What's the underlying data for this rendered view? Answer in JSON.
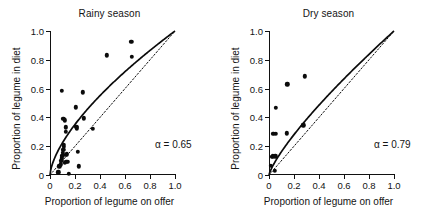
{
  "figure": {
    "background": "#ffffff",
    "marker_color": "#0b0b0b",
    "axis_color": "#111111"
  },
  "axis": {
    "x_title": "Proportion of legume on offer",
    "y_title": "Proportion of legume in diet",
    "ticks": [
      "0",
      "0.2",
      "0.4",
      "0.6",
      "0.8",
      "1.0"
    ],
    "tick_values": [
      0,
      0.2,
      0.4,
      0.6,
      0.8,
      1.0
    ],
    "xlim": [
      0,
      1.0
    ],
    "ylim": [
      0,
      1.0
    ]
  },
  "chart_data": [
    {
      "type": "scatter",
      "title": "Rainy season",
      "xlabel": "Proportion of legume on offer",
      "ylabel": "Proportion of legume in diet",
      "xlim": [
        0,
        1.0
      ],
      "ylim": [
        0,
        1.0
      ],
      "xticks": [
        0,
        0.2,
        0.4,
        0.6,
        0.8,
        1.0
      ],
      "yticks": [
        0,
        0.2,
        0.4,
        0.6,
        0.8,
        1.0
      ],
      "grid": false,
      "legend": "none",
      "annotation": "α = 0.65",
      "alpha": 0.65,
      "points": [
        {
          "x": 0.065,
          "y": 0.02
        },
        {
          "x": 0.075,
          "y": 0.06
        },
        {
          "x": 0.085,
          "y": 0.075
        },
        {
          "x": 0.09,
          "y": 0.1
        },
        {
          "x": 0.095,
          "y": 0.115
        },
        {
          "x": 0.098,
          "y": 0.135
        },
        {
          "x": 0.1,
          "y": 0.155
        },
        {
          "x": 0.105,
          "y": 0.175
        },
        {
          "x": 0.11,
          "y": 0.195
        },
        {
          "x": 0.112,
          "y": 0.21
        },
        {
          "x": 0.095,
          "y": 0.585
        },
        {
          "x": 0.105,
          "y": 0.39
        },
        {
          "x": 0.12,
          "y": 0.38
        },
        {
          "x": 0.125,
          "y": 0.33
        },
        {
          "x": 0.128,
          "y": 0.3
        },
        {
          "x": 0.12,
          "y": 0.085
        },
        {
          "x": 0.13,
          "y": 0.09
        },
        {
          "x": 0.14,
          "y": 0.09
        },
        {
          "x": 0.128,
          "y": 0.14
        },
        {
          "x": 0.135,
          "y": 0.145
        },
        {
          "x": 0.15,
          "y": 0.01
        },
        {
          "x": 0.205,
          "y": 0.47
        },
        {
          "x": 0.21,
          "y": 0.335
        },
        {
          "x": 0.215,
          "y": 0.325
        },
        {
          "x": 0.222,
          "y": 0.16
        },
        {
          "x": 0.228,
          "y": 0.06
        },
        {
          "x": 0.26,
          "y": 0.575
        },
        {
          "x": 0.27,
          "y": 0.395
        },
        {
          "x": 0.34,
          "y": 0.32
        },
        {
          "x": 0.455,
          "y": 0.83
        },
        {
          "x": 0.65,
          "y": 0.925
        },
        {
          "x": 0.655,
          "y": 0.82
        }
      ]
    },
    {
      "type": "scatter",
      "title": "Dry season",
      "xlabel": "Proportion of legume on offer",
      "ylabel": "Proportion of legume in diet",
      "xlim": [
        0,
        1.0
      ],
      "ylim": [
        0,
        1.0
      ],
      "xticks": [
        0,
        0.2,
        0.4,
        0.6,
        0.8,
        1.0
      ],
      "yticks": [
        0,
        0.2,
        0.4,
        0.6,
        0.8,
        1.0
      ],
      "grid": false,
      "legend": "none",
      "annotation": "α = 0.79",
      "alpha": 0.79,
      "points": [
        {
          "x": 0.015,
          "y": 0.065
        },
        {
          "x": 0.02,
          "y": 0.125
        },
        {
          "x": 0.03,
          "y": 0.13
        },
        {
          "x": 0.035,
          "y": 0.285
        },
        {
          "x": 0.048,
          "y": 0.03
        },
        {
          "x": 0.05,
          "y": 0.13
        },
        {
          "x": 0.052,
          "y": 0.285
        },
        {
          "x": 0.055,
          "y": 0.465
        },
        {
          "x": 0.14,
          "y": 0.29
        },
        {
          "x": 0.145,
          "y": 0.63
        },
        {
          "x": 0.275,
          "y": 0.345
        },
        {
          "x": 0.285,
          "y": 0.685
        }
      ]
    }
  ],
  "panels": [
    {
      "id": "rainy",
      "title": "Rainy season",
      "annotation": "α = 0.65"
    },
    {
      "id": "dry",
      "title": "Dry season",
      "annotation": "α = 0.79"
    }
  ]
}
